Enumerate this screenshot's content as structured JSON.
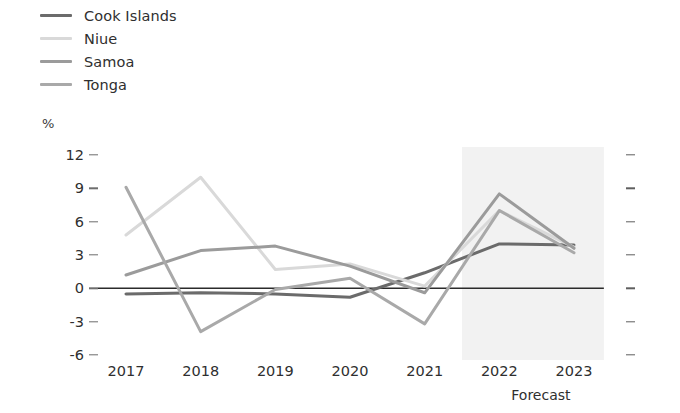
{
  "chart_data": {
    "type": "line",
    "title": "",
    "subtitle": "",
    "xlabel": "",
    "ylabel": "%",
    "unit_label": "%",
    "categories": [
      "2017",
      "2018",
      "2019",
      "2020",
      "2021",
      "2022",
      "2023"
    ],
    "x": [
      2017,
      2018,
      2019,
      2020,
      2021,
      2022,
      2023
    ],
    "ylim": [
      -6,
      12
    ],
    "y_ticks": [
      12,
      9,
      6,
      3,
      0,
      -3,
      -6
    ],
    "y_tick_labels": [
      "12",
      "9",
      "6",
      "3",
      "0",
      "-3",
      "-6"
    ],
    "grid": false,
    "zero_line": true,
    "legend_position": "top-left",
    "annotations": [
      {
        "text": "Forecast",
        "type": "shaded-band-caption",
        "x_start": 2021.5,
        "x_end": 2023.4
      }
    ],
    "shaded_region": {
      "label": "Forecast",
      "x_start": 2021.5,
      "x_end": 2023.4,
      "color": "#f2f2f2"
    },
    "series": [
      {
        "name": "Cook Islands",
        "color": "#6b6b6b",
        "values": [
          -0.5,
          -0.4,
          -0.5,
          -0.8,
          1.4,
          4.0,
          3.9
        ]
      },
      {
        "name": "Niue",
        "color": "#d9d9d9",
        "values": [
          4.8,
          10.0,
          1.7,
          2.2,
          0.2,
          7.0,
          3.7
        ]
      },
      {
        "name": "Samoa",
        "color": "#9b9b9b",
        "values": [
          1.2,
          3.4,
          3.8,
          2.0,
          -0.4,
          8.5,
          3.6
        ]
      },
      {
        "name": "Tonga",
        "color": "#a9a9a9",
        "values": [
          9.1,
          -3.9,
          -0.1,
          0.9,
          -3.2,
          7.0,
          3.2
        ]
      }
    ]
  },
  "legend": {
    "items": [
      {
        "label": "Cook Islands",
        "color": "#6b6b6b"
      },
      {
        "label": "Niue",
        "color": "#d9d9d9"
      },
      {
        "label": "Samoa",
        "color": "#9b9b9b"
      },
      {
        "label": "Tonga",
        "color": "#a9a9a9"
      }
    ]
  },
  "axes": {
    "y_unit": "%",
    "y_tick_labels": [
      "12",
      "9",
      "6",
      "3",
      "0",
      "-3",
      "-6"
    ],
    "x_tick_labels": [
      "2017",
      "2018",
      "2019",
      "2020",
      "2021",
      "2022",
      "2023"
    ]
  },
  "footer": {
    "forecast_label": "Forecast"
  },
  "colors": {
    "zero_line": "#2b2b2b",
    "tick": "#6d6d6d",
    "text": "#2f2f2f",
    "shaded_band": "#f2f2f2"
  }
}
